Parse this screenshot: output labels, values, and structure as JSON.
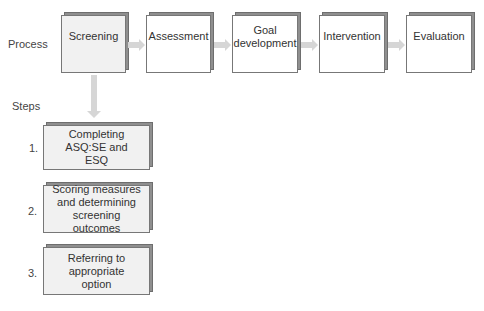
{
  "labels": {
    "process": "Process",
    "steps": "Steps"
  },
  "process": [
    {
      "label": "Screening",
      "highlighted": true
    },
    {
      "label": "Assessment",
      "highlighted": false
    },
    {
      "label": "Goal development",
      "highlighted": false
    },
    {
      "label": "Intervention",
      "highlighted": false
    },
    {
      "label": "Evaluation",
      "highlighted": false
    }
  ],
  "steps": [
    {
      "number": "1.",
      "label": "Completing ASQ:SE and ESQ"
    },
    {
      "number": "2.",
      "label": "Scoring measures and determining screening outcomes"
    },
    {
      "number": "3.",
      "label": "Referring to appropriate option"
    }
  ],
  "colors": {
    "box_border": "#777777",
    "shadow": "#8f8f8f",
    "arrow": "#d6d6d6",
    "highlight_fill": "#f1f1f1"
  }
}
